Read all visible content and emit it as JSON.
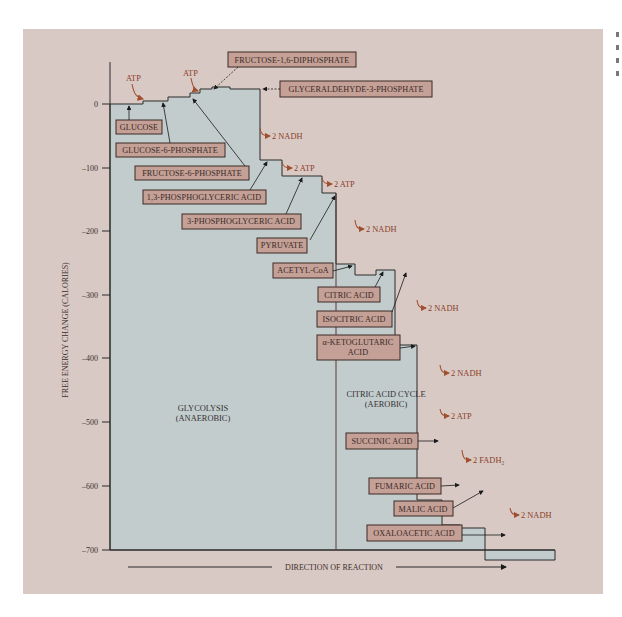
{
  "diagram": {
    "y_axis": {
      "label": "FREE ENERGY CHANGE (CALORIES)",
      "ticks": [
        "0",
        "–100",
        "–200",
        "–300",
        "–400",
        "–500",
        "–600",
        "–700"
      ]
    },
    "x_axis": {
      "label": "DIRECTION OF REACTION"
    },
    "regions": {
      "glycolysis": {
        "line1": "GLYCOLYSIS",
        "line2": "(ANAEROBIC)"
      },
      "citric": {
        "line1": "CITRIC ACID CYCLE",
        "line2": "(AEROBIC)"
      }
    },
    "compounds": [
      "GLUCOSE",
      "GLUCOSE-6-PHOSPHATE",
      "FRUCTOSE-6-PHOSPHATE",
      "FRUCTOSE-1,6-DIPHOSPHATE",
      "GLYCERALDEHYDE-3-PHOSPHATE",
      "1,3-PHOSPHOGLYCERIC ACID",
      "3-PHOSPHOGLYCERIC ACID",
      "PYRUVATE",
      "ACETYL-CoA",
      "CITRIC ACID",
      "ISOCITRIC ACID",
      "α-KETOGLUTARIC",
      "ACID",
      "SUCCINIC ACID",
      "FUMARIC ACID",
      "MALIC ACID",
      "OXALOACETIC ACID"
    ],
    "inputs": [
      "ATP",
      "ATP"
    ],
    "products": [
      "2 NADH",
      "2 ATP",
      "2 ATP",
      "2 NADH",
      "2 NADH",
      "2 NADH",
      "2 ATP",
      "2 FADH₂",
      "2 NADH"
    ],
    "colors": {
      "panel": "#d9c9c4",
      "area_fill": "#c3cccd",
      "label_box": "#c4a096",
      "label_border": "#3a2a26",
      "product_text": "#8a3f2a",
      "product_arrow": "#a0502f"
    }
  }
}
